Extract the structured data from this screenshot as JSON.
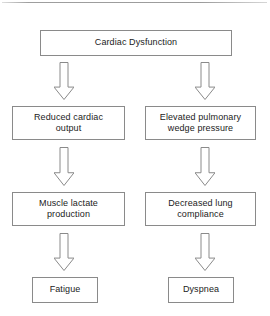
{
  "diagram": {
    "background_color": "#ffffff",
    "box_border_color": "#8a8a8a",
    "text_color": "#1b1b1b",
    "arrow_outline_color": "#8a8a8a",
    "arrow_fill_color": "#ffffff",
    "top_rule_color": "#8a8a8a",
    "nodes": [
      {
        "id": "cardiac-dysfunction",
        "label": "Cardiac Dysfunction",
        "x": 40,
        "y": 30,
        "width": 192,
        "height": 26
      },
      {
        "id": "reduced-cardiac-output",
        "label": "Reduced cardiac\noutput",
        "x": 12,
        "y": 106,
        "width": 113,
        "height": 34
      },
      {
        "id": "elevated-pulmonary-wedge-pressure",
        "label": "Elevated pulmonary\nwedge pressure",
        "x": 145,
        "y": 106,
        "width": 111,
        "height": 34
      },
      {
        "id": "muscle-lactate-production",
        "label": "Muscle lactate\nproduction",
        "x": 12,
        "y": 192,
        "width": 113,
        "height": 34
      },
      {
        "id": "decreased-lung-compliance",
        "label": "Decreased lung\ncompliance",
        "x": 145,
        "y": 192,
        "width": 111,
        "height": 34
      },
      {
        "id": "fatigue",
        "label": "Fatigue",
        "x": 32,
        "y": 277,
        "width": 66,
        "height": 26
      },
      {
        "id": "dyspnea",
        "label": "Dyspnea",
        "x": 168,
        "y": 277,
        "width": 66,
        "height": 26
      }
    ],
    "arrows": [
      {
        "id": "arrow-dysfunction-to-output",
        "from": "cardiac-dysfunction",
        "to": "reduced-cardiac-output",
        "x": 54,
        "y": 62,
        "width": 20,
        "height": 38
      },
      {
        "id": "arrow-dysfunction-to-wedge",
        "from": "cardiac-dysfunction",
        "to": "elevated-pulmonary-wedge-pressure",
        "x": 195,
        "y": 62,
        "width": 20,
        "height": 38
      },
      {
        "id": "arrow-output-to-lactate",
        "from": "reduced-cardiac-output",
        "to": "muscle-lactate-production",
        "x": 54,
        "y": 147,
        "width": 20,
        "height": 39
      },
      {
        "id": "arrow-wedge-to-compliance",
        "from": "elevated-pulmonary-wedge-pressure",
        "to": "decreased-lung-compliance",
        "x": 195,
        "y": 147,
        "width": 20,
        "height": 39
      },
      {
        "id": "arrow-lactate-to-fatigue",
        "from": "muscle-lactate-production",
        "to": "fatigue",
        "x": 54,
        "y": 233,
        "width": 20,
        "height": 38
      },
      {
        "id": "arrow-compliance-to-dyspnea",
        "from": "decreased-lung-compliance",
        "to": "dyspnea",
        "x": 195,
        "y": 233,
        "width": 20,
        "height": 38
      }
    ]
  }
}
